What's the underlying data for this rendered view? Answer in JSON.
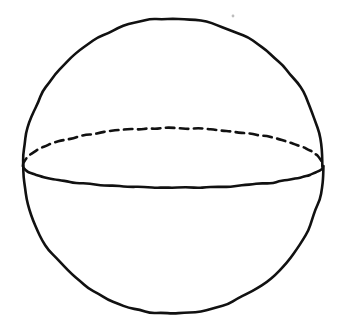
{
  "figure": {
    "kind": "geometry-figure",
    "canvas": {
      "width": 338,
      "height": 325,
      "background_color": "#ffffff"
    },
    "ink_color": "#111111",
    "stroke_width": 2.6,
    "elements": [
      {
        "name": "sphere-outline",
        "shape": "circle",
        "center_x": 173,
        "center_y": 166,
        "radius_x": 150,
        "radius_y": 148,
        "style": "solid",
        "label": ""
      },
      {
        "name": "equator-back-arc",
        "shape": "ellipse-arc-upper",
        "center_x": 173,
        "center_y": 166,
        "radius_x": 150,
        "radius_y": 38,
        "style": "dashed",
        "dash_length": 8.5,
        "gap_length": 5.5,
        "label": ""
      },
      {
        "name": "equator-front-arc",
        "shape": "ellipse-arc-lower",
        "center_x": 173,
        "center_y": 166,
        "radius_x": 150,
        "radius_y": 22,
        "style": "solid",
        "label": ""
      },
      {
        "name": "scan-speck",
        "shape": "dot",
        "center_x": 233,
        "center_y": 16,
        "radius_x": 1.4,
        "radius_y": 1.4,
        "style": "faint",
        "label": ""
      }
    ],
    "labels": [],
    "caption": ""
  }
}
